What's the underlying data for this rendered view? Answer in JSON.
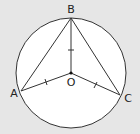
{
  "diagram": {
    "type": "geometry-circle-inscribed-triangle",
    "background": "#e6e6e6",
    "circle": {
      "cx": 71,
      "cy": 73,
      "r": 55,
      "fill": "#ffffff",
      "stroke": "#333333"
    },
    "points": {
      "A": {
        "label": "A",
        "x": 21,
        "y": 91
      },
      "B": {
        "label": "B",
        "x": 71,
        "y": 18
      },
      "C": {
        "label": "C",
        "x": 120,
        "y": 95
      },
      "O": {
        "label": "O",
        "x": 71,
        "y": 73
      }
    },
    "segments": [
      "AB",
      "BC",
      "OA",
      "OB",
      "OC"
    ],
    "equal_marks": [
      "OA",
      "OB",
      "OC"
    ]
  }
}
